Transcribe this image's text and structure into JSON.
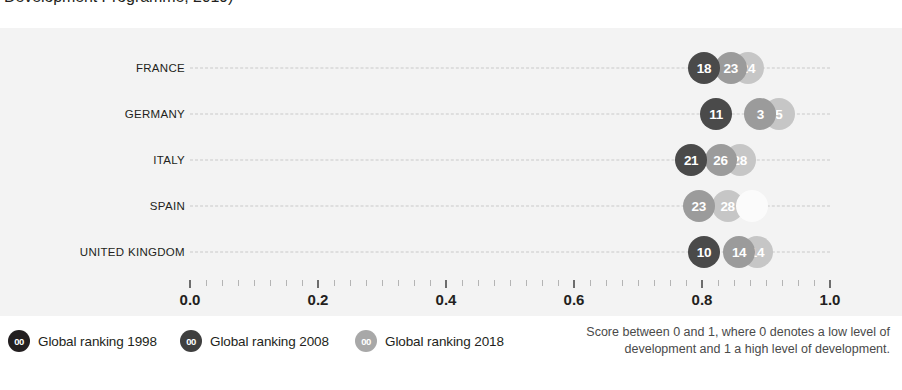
{
  "title": {
    "clipped_text": "Development Programme, 2019)"
  },
  "chart_data": {
    "type": "scatter",
    "title": "Development Programme, 2019)",
    "xlabel": "",
    "ylabel": "",
    "xlim": [
      0.0,
      1.0
    ],
    "xticks": [
      "0.0",
      "0.2",
      "0.4",
      "0.6",
      "0.8",
      "1.0"
    ],
    "xtick_values": [
      0.0,
      0.2,
      0.4,
      0.6,
      0.8,
      1.0
    ],
    "minor_tick_step": 0.025,
    "grid": "dashed-row-guides",
    "legend_position": "bottom-left",
    "categories": [
      "FRANCE",
      "GERMANY",
      "ITALY",
      "SPAIN",
      "UNITED KINGDOM"
    ],
    "series": [
      {
        "name": "Global ranking 1998",
        "color": "#4a4a4a",
        "values": [
          0.803,
          0.822,
          0.783,
          0.795,
          0.803
        ],
        "labels": [
          "18",
          "11",
          "21",
          "23",
          "10"
        ]
      },
      {
        "name": "Global ranking 2008",
        "color": "#9b9b9b",
        "values": [
          0.845,
          0.891,
          0.829,
          0.84,
          0.858
        ]
      },
      {
        "name": "Global ranking 2018",
        "color": "#c6c6c6",
        "values": [
          0.872,
          0.92,
          0.859,
          0.878,
          0.886
        ],
        "labels": [
          "24",
          "5",
          "28",
          "",
          "14"
        ]
      }
    ],
    "annotations": [
      "Score between 0 and 1, where 0 denotes a low level of development and 1 a high level of development."
    ]
  },
  "rows": [
    {
      "label": "FRANCE",
      "bubbles": [
        {
          "series": "1998",
          "value": 0.803,
          "label": "18",
          "tone": "dark"
        },
        {
          "series": "2008",
          "value": 0.845,
          "label": "23",
          "tone": "medium"
        },
        {
          "series": "2018",
          "value": 0.872,
          "label": "24",
          "tone": "light"
        }
      ]
    },
    {
      "label": "GERMANY",
      "bubbles": [
        {
          "series": "1998",
          "value": 0.822,
          "label": "11",
          "tone": "dark"
        },
        {
          "series": "2008",
          "value": 0.891,
          "label": "3",
          "tone": "medium"
        },
        {
          "series": "2018",
          "value": 0.92,
          "label": "5",
          "tone": "light"
        }
      ]
    },
    {
      "label": "ITALY",
      "bubbles": [
        {
          "series": "1998",
          "value": 0.783,
          "label": "21",
          "tone": "dark"
        },
        {
          "series": "2008",
          "value": 0.829,
          "label": "26",
          "tone": "medium"
        },
        {
          "series": "2018",
          "value": 0.859,
          "label": "28",
          "tone": "light"
        }
      ]
    },
    {
      "label": "SPAIN",
      "bubbles": [
        {
          "series": "1998",
          "value": 0.795,
          "label": "23",
          "tone": "medium"
        },
        {
          "series": "2008",
          "value": 0.84,
          "label": "28",
          "tone": "light"
        },
        {
          "series": "2018",
          "value": 0.878,
          "label": "",
          "tone": "faint"
        }
      ]
    },
    {
      "label": "UNITED KINGDOM",
      "bubbles": [
        {
          "series": "1998",
          "value": 0.803,
          "label": "10",
          "tone": "dark"
        },
        {
          "series": "2008",
          "value": 0.858,
          "label": "14",
          "tone": "medium"
        },
        {
          "series": "2018",
          "value": 0.886,
          "label": "14",
          "tone": "light"
        }
      ]
    }
  ],
  "axis": {
    "labels": [
      "0.0",
      "0.2",
      "0.4",
      "0.6",
      "0.8",
      "1.0"
    ]
  },
  "legend": {
    "marker_text": "00",
    "items": [
      {
        "label": "Global ranking 1998",
        "color": "#231f20"
      },
      {
        "label": "Global ranking 2008",
        "color": "#3f3f3f"
      },
      {
        "label": "Global ranking 2018",
        "color": "#a8a8a8"
      }
    ]
  },
  "caption": {
    "text": "Score between 0 and 1, where 0 denotes a low level of development and 1 a high level of development."
  }
}
